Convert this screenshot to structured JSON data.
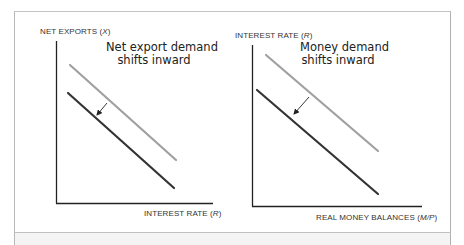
{
  "panels": [
    {
      "id": "net-exports",
      "y_axis_label": "NET EXPORTS",
      "y_axis_symbol": "X",
      "x_axis_label": "INTEREST RATE",
      "x_axis_symbol": "R",
      "annotation_line1": "Net export demand",
      "annotation_line2": "shifts inward",
      "curves": [
        {
          "name": "original-demand",
          "color": "#a0a0a0",
          "x1": 70,
          "y1": 65,
          "x2": 176,
          "y2": 160
        },
        {
          "name": "shifted-demand",
          "color": "#333333",
          "x1": 68,
          "y1": 93,
          "x2": 174,
          "y2": 188
        }
      ],
      "arrow": {
        "x1": 107,
        "y1": 103,
        "x2": 97,
        "y2": 115
      }
    },
    {
      "id": "money-demand",
      "y_axis_label": "INTEREST RATE",
      "y_axis_symbol": "R",
      "x_axis_label": "REAL MONEY BALANCES",
      "x_axis_symbol": "M/P",
      "annotation_line1": "Money demand",
      "annotation_line2": "shifts inward",
      "curves": [
        {
          "name": "original-demand",
          "color": "#a0a0a0",
          "x1": 266,
          "y1": 55,
          "x2": 378,
          "y2": 151
        },
        {
          "name": "shifted-demand",
          "color": "#333333",
          "x1": 257,
          "y1": 90,
          "x2": 378,
          "y2": 194
        }
      ],
      "arrow": {
        "x1": 309,
        "y1": 97,
        "x2": 294,
        "y2": 114
      }
    }
  ],
  "colors": {
    "original_curve": "#a0a0a0",
    "shifted_curve": "#333333",
    "axis": "#222222",
    "frame": "#b8b8b8"
  }
}
